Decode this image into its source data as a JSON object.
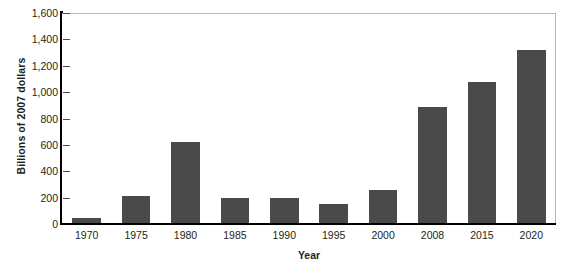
{
  "chart_data": {
    "type": "bar",
    "title": "",
    "xlabel": "Year",
    "ylabel": "Billions of 2007 dollars",
    "categories": [
      "1970",
      "1975",
      "1980",
      "1985",
      "1990",
      "1995",
      "2000",
      "2008",
      "2015",
      "2020"
    ],
    "values": [
      45,
      210,
      620,
      200,
      200,
      155,
      260,
      890,
      1080,
      1320
    ],
    "ylim": [
      0,
      1600
    ],
    "ytick_step": 200,
    "ytick_labels": [
      "1,600",
      "1,400",
      "1,200",
      "1,000",
      "800",
      "600",
      "400",
      "200",
      "0"
    ],
    "ytick_values": [
      1600,
      1400,
      1200,
      1000,
      800,
      600,
      400,
      200,
      0
    ],
    "grid": false,
    "legend": null,
    "legend_position": "none",
    "bar_color": "#4a4a4a",
    "axis_color": "#000000",
    "plot_border_color": "#b9b9b9",
    "background_color": "#ffffff",
    "text_color": "#231f20"
  }
}
